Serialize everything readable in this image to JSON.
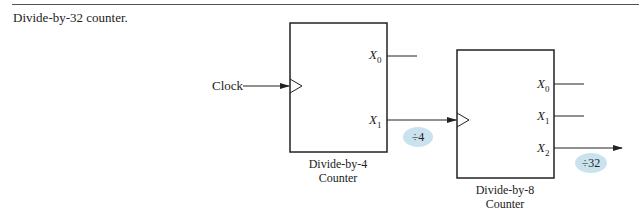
{
  "figure": {
    "caption": "Divide-by-32 counter."
  },
  "input": {
    "label": "Clock"
  },
  "counters": [
    {
      "name_line1": "Divide-by-4",
      "name_line2": "Counter",
      "outputs": [
        {
          "var": "X",
          "sub": "0"
        },
        {
          "var": "X",
          "sub": "1"
        }
      ]
    },
    {
      "name_line1": "Divide-by-8",
      "name_line2": "Counter",
      "outputs": [
        {
          "var": "X",
          "sub": "0"
        },
        {
          "var": "X",
          "sub": "1"
        },
        {
          "var": "X",
          "sub": "2"
        }
      ]
    }
  ],
  "badges": [
    {
      "label": "÷4"
    },
    {
      "label": "÷32"
    }
  ],
  "colors": {
    "line": "#222222",
    "badge_fill": "#c9e2ee"
  }
}
